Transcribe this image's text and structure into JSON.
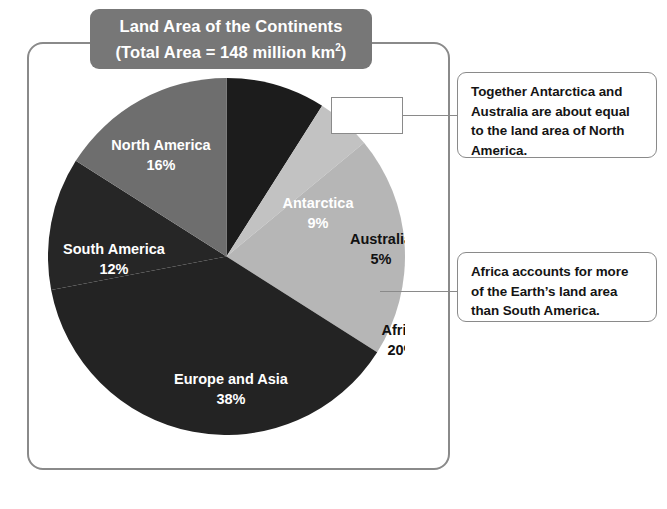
{
  "title": {
    "line1": "Land Area of the Continents",
    "line2_prefix": "(Total Area  =  148 million km",
    "line2_sup": "2",
    "line2_suffix": ")",
    "background_color": "#777777",
    "text_color": "#ffffff"
  },
  "frame": {
    "border_color": "#8a8a8a"
  },
  "chart_data": {
    "type": "pie",
    "title": "Land Area of the Continents (Total Area = 148 million km2)",
    "total_label": "Total Area = 148 million km2",
    "total_value": 148,
    "total_unit": "million km2",
    "units": "percent",
    "legend": "none",
    "start_angle_deg": 0,
    "direction": "clockwise",
    "categories": [
      "Antarctica",
      "Australia",
      "Africa",
      "Europe and Asia",
      "South America",
      "North America"
    ],
    "values": [
      9,
      5,
      20,
      38,
      12,
      16
    ],
    "slices": [
      {
        "name": "Antarctica",
        "label": "Antarctica",
        "value": 9,
        "pct_label": "9%",
        "color": "#1c1c1c",
        "text_color": "#ffffff",
        "label_x": 270,
        "label_y": 130,
        "pct_x": 270,
        "pct_y": 150
      },
      {
        "name": "Australia",
        "label": "Australia",
        "value": 5,
        "pct_label": "5%",
        "color": "#c2c2c2",
        "text_color": "#111111",
        "label_x": 333,
        "label_y": 166,
        "pct_x": 333,
        "pct_y": 186
      },
      {
        "name": "Africa",
        "label": "Africa",
        "value": 20,
        "pct_label": "20%",
        "color": "#b6b6b6",
        "text_color": "#111111",
        "label_x": 354,
        "label_y": 257,
        "pct_x": 354,
        "pct_y": 277
      },
      {
        "name": "Europe and Asia",
        "label": "Europe and Asia",
        "value": 38,
        "pct_label": "38%",
        "color": "#232323",
        "text_color": "#ffffff",
        "label_x": 183,
        "label_y": 306,
        "pct_x": 183,
        "pct_y": 326
      },
      {
        "name": "South America",
        "label": "South America",
        "value": 12,
        "pct_label": "12%",
        "color": "#262626",
        "text_color": "#ffffff",
        "label_x": 66,
        "label_y": 176,
        "pct_x": 66,
        "pct_y": 196
      },
      {
        "name": "North America",
        "label": "North America",
        "value": 16,
        "pct_label": "16%",
        "color": "#6e6e6e",
        "text_color": "#ffffff",
        "label_x": 113,
        "label_y": 72,
        "pct_x": 113,
        "pct_y": 92
      }
    ]
  },
  "callouts": [
    {
      "name": "antarctica-australia-note",
      "text": "Together Antarctica and Australia are about equal to the land area of North America."
    },
    {
      "name": "africa-note",
      "text": "Africa accounts for more of the Earth’s land area than South America."
    }
  ]
}
